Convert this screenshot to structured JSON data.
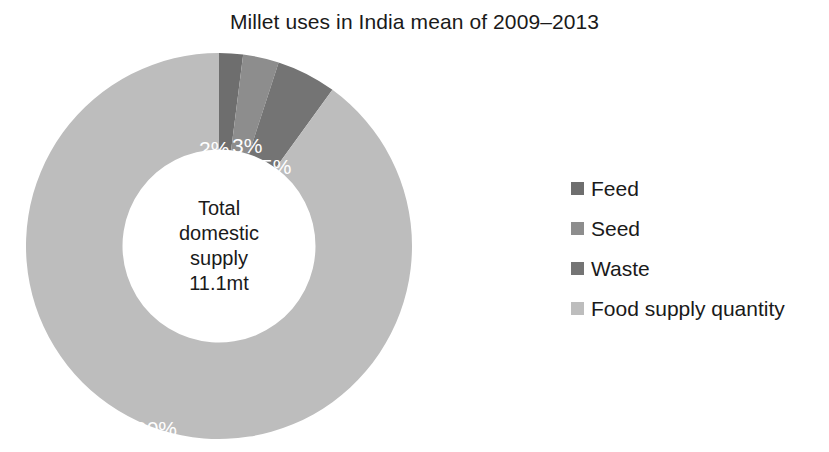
{
  "chart_data": {
    "type": "pie",
    "variant": "donut",
    "title": "Millet uses in India mean of 2009–2013",
    "xlabel": "",
    "ylabel": "",
    "grid": false,
    "legend_position": "right",
    "start_angle_deg": 0,
    "direction": "clockwise",
    "inner_radius_ratio": 0.5,
    "categories": [
      "Feed",
      "Seed",
      "Waste",
      "Food supply quantity"
    ],
    "values": [
      2,
      3,
      5,
      90
    ],
    "value_unit": "percent",
    "data_labels": [
      "2%",
      "3%",
      "5%",
      "90%"
    ],
    "colors": [
      "#6e6e6e",
      "#8d8d8d",
      "#747474",
      "#bdbdbd"
    ],
    "center_annotation": {
      "lines": [
        "Total",
        "domestic",
        "supply",
        "11.1mt"
      ],
      "total_value": "11.1mt"
    },
    "slices": [
      {
        "label": "Feed",
        "value": 2,
        "data_label": "2%",
        "color": "#6e6e6e"
      },
      {
        "label": "Seed",
        "value": 3,
        "data_label": "3%",
        "color": "#8d8d8d"
      },
      {
        "label": "Waste",
        "value": 5,
        "data_label": "5%",
        "color": "#747474"
      },
      {
        "label": "Food supply quantity",
        "value": 90,
        "data_label": "90%",
        "color": "#bdbdbd"
      }
    ]
  },
  "title": {
    "text": "Millet uses in India mean of 2009–2013"
  },
  "donut": {
    "center": {
      "line1": "Total",
      "line2": "domestic",
      "line3": "supply",
      "line4": "11.1mt"
    },
    "labels": {
      "feed": "2%",
      "seed": "3%",
      "waste": "5%",
      "food": "90%"
    }
  },
  "legend": {
    "items": [
      {
        "label": "Feed",
        "color": "#6e6e6e"
      },
      {
        "label": "Seed",
        "color": "#8d8d8d"
      },
      {
        "label": "Waste",
        "color": "#747474"
      },
      {
        "label": "Food supply quantity",
        "color": "#bdbdbd"
      }
    ]
  }
}
